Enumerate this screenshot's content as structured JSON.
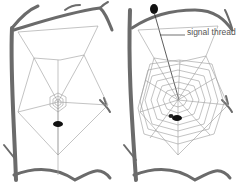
{
  "diagram": {
    "panels": [
      {
        "id": "left",
        "description": "Early web: frame, radii and small central spiral with spider below hub"
      },
      {
        "id": "right",
        "description": "Complete orb web with spiral; spider hides on branch holding signal thread"
      }
    ],
    "labels": {
      "signal_thread": "signal thread"
    },
    "colors": {
      "branch": "#6b6b6b",
      "silk": "#9a9a9a",
      "spider": "#111111",
      "label": "#555555"
    }
  }
}
